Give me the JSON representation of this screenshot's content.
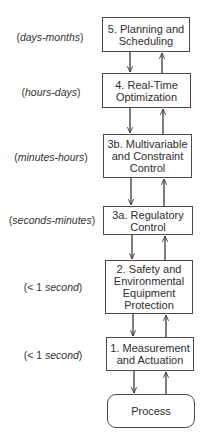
{
  "diagram": {
    "type": "hierarchical control levels",
    "levels": [
      {
        "id": "5",
        "label": "5. Planning and\nScheduling",
        "timescale_prefix": "(",
        "timescale_italic": "days-months",
        "timescale_suffix": ")"
      },
      {
        "id": "4",
        "label": "4. Real-Time\nOptimization",
        "timescale_prefix": "(",
        "timescale_italic": "hours-days",
        "timescale_suffix": ")"
      },
      {
        "id": "3b",
        "label": "3b. Multivariable\nand Constraint\nControl",
        "timescale_prefix": "(",
        "timescale_italic": "minutes-hours",
        "timescale_suffix": ")"
      },
      {
        "id": "3a",
        "label": "3a. Regulatory\nControl",
        "timescale_prefix": "(",
        "timescale_italic": "seconds-minutes",
        "timescale_suffix": ")"
      },
      {
        "id": "2",
        "label": "2. Safety and\nEnvironmental\nEquipment\nProtection",
        "timescale_prefix": "(< 1 ",
        "timescale_italic": "second",
        "timescale_suffix": ")"
      },
      {
        "id": "1",
        "label": "1. Measurement\nand Actuation",
        "timescale_prefix": "(< 1 ",
        "timescale_italic": "second",
        "timescale_suffix": ")"
      }
    ],
    "process": {
      "label": "Process"
    },
    "connections": "each adjacent pair linked by a downward arrow (left) and an upward arrow (right)",
    "colors": {
      "line": "#3a3a3a",
      "box_border": "#4a4a4a",
      "text": "#2e2e2e",
      "background": "#ffffff"
    }
  }
}
